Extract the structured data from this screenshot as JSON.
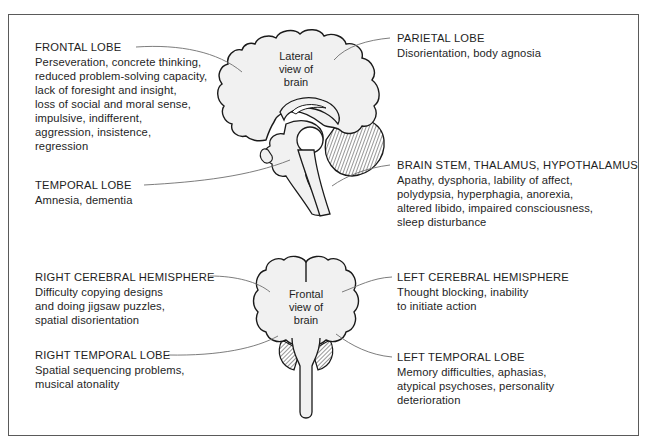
{
  "figure": {
    "lateral_view_label": [
      "Lateral",
      "view of",
      "brain"
    ],
    "frontal_view_label": [
      "Frontal",
      "view of",
      "brain"
    ]
  },
  "regions": {
    "frontal_lobe": {
      "title": "FRONTAL LOBE",
      "lines": [
        "Perseveration, concrete thinking,",
        "reduced problem-solving capacity,",
        "lack of foresight and insight,",
        "loss of social and moral sense,",
        "impulsive, indifferent,",
        "aggression, insistence,",
        "regression"
      ]
    },
    "temporal_lobe": {
      "title": "TEMPORAL LOBE",
      "lines": [
        "Amnesia, dementia"
      ]
    },
    "parietal_lobe": {
      "title": "PARIETAL LOBE",
      "lines": [
        "Disorientation, body agnosia"
      ]
    },
    "brain_stem": {
      "title": "BRAIN STEM, THALAMUS, HYPOTHALAMUS",
      "lines": [
        "Apathy, dysphoria, lability of affect,",
        "polydypsia, hyperphagia, anorexia,",
        "altered libido, impaired consciousness,",
        "sleep disturbance"
      ]
    },
    "right_cerebral_hemisphere": {
      "title": "RIGHT CEREBRAL HEMISPHERE",
      "lines": [
        "Difficulty copying designs",
        "and doing jigsaw puzzles,",
        "spatial disorientation"
      ]
    },
    "right_temporal_lobe": {
      "title": "RIGHT TEMPORAL LOBE",
      "lines": [
        "Spatial sequencing problems,",
        "musical atonality"
      ]
    },
    "left_cerebral_hemisphere": {
      "title": "LEFT CEREBRAL HEMISPHERE",
      "lines": [
        "Thought blocking, inability",
        "to initiate action"
      ]
    },
    "left_temporal_lobe": {
      "title": "LEFT TEMPORAL LOBE",
      "lines": [
        "Memory difficulties, aphasias,",
        "atypical psychoses, personality",
        "deterioration"
      ]
    }
  },
  "colors": {
    "brain_fill": "#f1f1f1",
    "outline": "#1a1a1a",
    "leader_line": "#6e6e6e",
    "frame": "#5a5a5a"
  }
}
